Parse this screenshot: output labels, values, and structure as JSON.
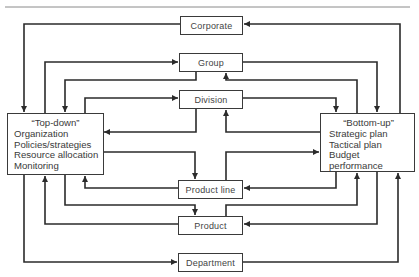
{
  "diagram": {
    "levels": [
      {
        "id": "corporate",
        "label": "Corporate"
      },
      {
        "id": "group",
        "label": "Group"
      },
      {
        "id": "division",
        "label": "Division"
      },
      {
        "id": "product_line",
        "label": "Product line"
      },
      {
        "id": "product",
        "label": "Product"
      },
      {
        "id": "department",
        "label": "Department"
      }
    ],
    "top_down": {
      "title": "“Top-down”",
      "items": [
        "Organization",
        "Policies/strategies",
        "Resource allocation",
        "Monitoring"
      ]
    },
    "bottom_up": {
      "title": "“Bottom-up”",
      "items": [
        "Strategic plan",
        "Tactical plan",
        "Budget performance"
      ]
    },
    "colors": {
      "line": "#2b2b2b",
      "box_border": "#3a3a3a",
      "text": "#444444"
    }
  }
}
